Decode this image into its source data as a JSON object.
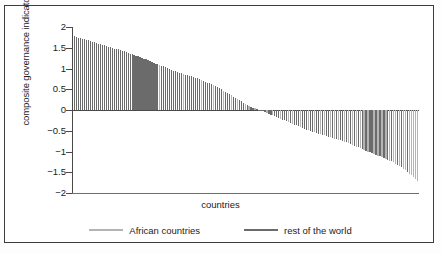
{
  "chart_data": {
    "type": "bar",
    "title": "",
    "xlabel": "countries",
    "ylabel": "composite governance indicator",
    "ylim": [
      -2,
      2
    ],
    "yticks": [
      2,
      1.5,
      1,
      0.5,
      0,
      -0.5,
      -1,
      -1.5,
      -2
    ],
    "ytick_labels": [
      "2",
      "1.5",
      "1",
      "0.5",
      "0",
      "−0.5",
      "−1",
      "−1.5",
      "−2"
    ],
    "grid": false,
    "legend_position": "bottom",
    "xaxis_ticks_shown": false,
    "series": [
      {
        "name": "African countries",
        "color": "#b4b4b4"
      },
      {
        "name": "rest of the world",
        "color": "#6b6b6b"
      }
    ],
    "note": "Each bar is one country, sorted descending by composite governance indicator. group = 0 -> African countries (light grey), 1 -> rest of the world (dark grey).",
    "values": [
      1.78,
      1.76,
      1.74,
      1.73,
      1.72,
      1.7,
      1.69,
      1.68,
      1.66,
      1.65,
      1.63,
      1.62,
      1.6,
      1.59,
      1.57,
      1.56,
      1.55,
      1.53,
      1.52,
      1.5,
      1.48,
      1.47,
      1.46,
      1.44,
      1.43,
      1.41,
      1.4,
      1.38,
      1.36,
      1.35,
      1.33,
      1.31,
      1.3,
      1.28,
      1.26,
      1.24,
      1.22,
      1.2,
      1.18,
      1.16,
      1.14,
      1.12,
      1.1,
      1.09,
      1.07,
      1.05,
      1.03,
      1.01,
      0.99,
      0.97,
      0.95,
      0.93,
      0.91,
      0.89,
      0.88,
      0.86,
      0.85,
      0.84,
      0.83,
      0.82,
      0.8,
      0.78,
      0.76,
      0.74,
      0.72,
      0.7,
      0.68,
      0.66,
      0.64,
      0.62,
      0.6,
      0.58,
      0.56,
      0.53,
      0.5,
      0.47,
      0.44,
      0.41,
      0.38,
      0.35,
      0.32,
      0.3,
      0.27,
      0.24,
      0.21,
      0.18,
      0.15,
      0.12,
      0.1,
      0.08,
      0.06,
      0.04,
      0.02,
      0.01,
      -0.01,
      -0.03,
      -0.05,
      -0.07,
      -0.09,
      -0.11,
      -0.13,
      -0.15,
      -0.17,
      -0.19,
      -0.21,
      -0.23,
      -0.25,
      -0.27,
      -0.29,
      -0.31,
      -0.33,
      -0.35,
      -0.37,
      -0.39,
      -0.41,
      -0.43,
      -0.45,
      -0.47,
      -0.49,
      -0.5,
      -0.52,
      -0.54,
      -0.55,
      -0.57,
      -0.58,
      -0.6,
      -0.61,
      -0.63,
      -0.64,
      -0.66,
      -0.67,
      -0.69,
      -0.7,
      -0.72,
      -0.73,
      -0.75,
      -0.77,
      -0.78,
      -0.8,
      -0.82,
      -0.84,
      -0.86,
      -0.88,
      -0.9,
      -0.92,
      -0.94,
      -0.96,
      -0.98,
      -1.0,
      -1.02,
      -1.04,
      -1.06,
      -1.08,
      -1.1,
      -1.12,
      -1.14,
      -1.16,
      -1.18,
      -1.2,
      -1.22,
      -1.24,
      -1.26,
      -1.29,
      -1.32,
      -1.35,
      -1.38,
      -1.41,
      -1.45,
      -1.49,
      -1.53,
      -1.57,
      -1.62,
      -1.67,
      -1.72
    ],
    "groups": [
      1,
      1,
      1,
      1,
      1,
      1,
      1,
      1,
      1,
      1,
      1,
      1,
      1,
      1,
      1,
      1,
      1,
      1,
      1,
      1,
      1,
      1,
      1,
      1,
      1,
      1,
      1,
      1,
      1,
      1,
      1,
      1,
      1,
      1,
      1,
      1,
      1,
      1,
      1,
      1,
      1,
      1,
      1,
      0,
      1,
      1,
      1,
      1,
      1,
      1,
      1,
      1,
      1,
      1,
      1,
      0,
      1,
      1,
      1,
      1,
      1,
      1,
      1,
      1,
      0,
      1,
      1,
      1,
      1,
      1,
      0,
      1,
      1,
      1,
      1,
      0,
      1,
      1,
      1,
      0,
      1,
      1,
      0,
      1,
      1,
      1,
      0,
      1,
      0,
      1,
      1,
      0,
      1,
      1,
      1,
      1,
      1,
      0,
      1,
      1,
      0,
      1,
      1,
      1,
      0,
      1,
      1,
      1,
      0,
      1,
      0,
      1,
      1,
      1,
      0,
      1,
      1,
      1,
      0,
      1,
      1,
      0,
      1,
      1,
      0,
      1,
      0,
      1,
      1,
      0,
      1,
      0,
      1,
      0,
      1,
      1,
      0,
      1,
      0,
      1,
      0,
      1,
      0,
      1,
      0,
      1,
      0,
      1,
      0,
      1,
      1,
      0,
      1,
      0,
      1,
      0,
      1,
      0,
      1,
      0,
      1,
      0,
      0,
      1,
      0,
      1,
      0,
      0,
      1,
      0,
      0,
      0,
      0,
      0,
      0
    ]
  },
  "legend": {
    "entries": [
      {
        "label": "African countries",
        "color": "#b4b4b4"
      },
      {
        "label": "rest of the world",
        "color": "#6b6b6b"
      }
    ]
  },
  "axis": {
    "ylabel": "composite governance indicator",
    "xlabel": "countries",
    "ytick_labels": [
      "2",
      "1.5",
      "1",
      "0.5",
      "0",
      "−0.5",
      "−1",
      "−1.5",
      "−2"
    ]
  }
}
